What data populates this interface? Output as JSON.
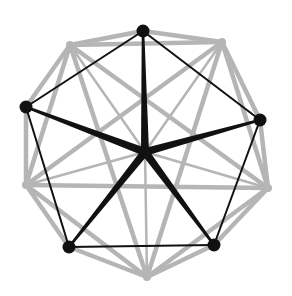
{
  "diagram": {
    "width": 292,
    "height": 296,
    "background": "#ffffff",
    "colors": {
      "primary": "#111111",
      "secondary": "#b5b5b5"
    },
    "center": {
      "id": "c",
      "x": 145,
      "y": 152
    },
    "primary_nodes": [
      {
        "id": "b1",
        "x": 143,
        "y": 31
      },
      {
        "id": "b2",
        "x": 260,
        "y": 120
      },
      {
        "id": "b3",
        "x": 214,
        "y": 245
      },
      {
        "id": "b4",
        "x": 69,
        "y": 247
      },
      {
        "id": "b5",
        "x": 26,
        "y": 107
      }
    ],
    "secondary_nodes": [
      {
        "id": "g1",
        "x": 70,
        "y": 45
      },
      {
        "id": "g2",
        "x": 222,
        "y": 42
      },
      {
        "id": "g3",
        "x": 268,
        "y": 188
      },
      {
        "id": "g4",
        "x": 147,
        "y": 277
      },
      {
        "id": "g5",
        "x": 26,
        "y": 185
      }
    ],
    "primary_ring_edges": [
      [
        "b1",
        "b2"
      ],
      [
        "b2",
        "b3"
      ],
      [
        "b3",
        "b4"
      ],
      [
        "b4",
        "b5"
      ],
      [
        "b5",
        "b1"
      ]
    ],
    "primary_spokes": [
      [
        "c",
        "b1"
      ],
      [
        "c",
        "b2"
      ],
      [
        "c",
        "b3"
      ],
      [
        "c",
        "b4"
      ],
      [
        "c",
        "b5"
      ]
    ],
    "secondary_edges": [
      [
        "g1",
        "g2"
      ],
      [
        "g2",
        "g3"
      ],
      [
        "g3",
        "g4"
      ],
      [
        "g4",
        "g5"
      ],
      [
        "g5",
        "g1"
      ],
      [
        "g1",
        "g3"
      ],
      [
        "g1",
        "g4"
      ],
      [
        "g2",
        "g4"
      ],
      [
        "g2",
        "g5"
      ],
      [
        "g3",
        "g5"
      ],
      [
        "b1",
        "g1"
      ],
      [
        "b1",
        "g2"
      ],
      [
        "b2",
        "g2"
      ],
      [
        "b2",
        "g3"
      ],
      [
        "b3",
        "g3"
      ],
      [
        "b3",
        "g4"
      ],
      [
        "b4",
        "g4"
      ],
      [
        "b4",
        "g5"
      ],
      [
        "b5",
        "g5"
      ],
      [
        "b5",
        "g1"
      ]
    ],
    "secondary_spokes": [
      [
        "c",
        "g1"
      ],
      [
        "c",
        "g2"
      ],
      [
        "c",
        "g3"
      ],
      [
        "c",
        "g4"
      ],
      [
        "c",
        "g5"
      ]
    ]
  }
}
